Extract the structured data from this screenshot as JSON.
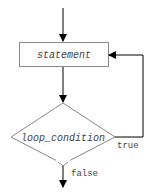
{
  "diagram": {
    "type": "flowchart",
    "nodes": {
      "statement": {
        "label": "statement",
        "shape": "rectangle"
      },
      "condition": {
        "label": "loop_condition",
        "shape": "diamond"
      }
    },
    "edges": {
      "true_label": "true",
      "false_label": "false"
    },
    "colors": {
      "line": "#000000",
      "box_border": "#888888",
      "text": "#444444"
    }
  }
}
